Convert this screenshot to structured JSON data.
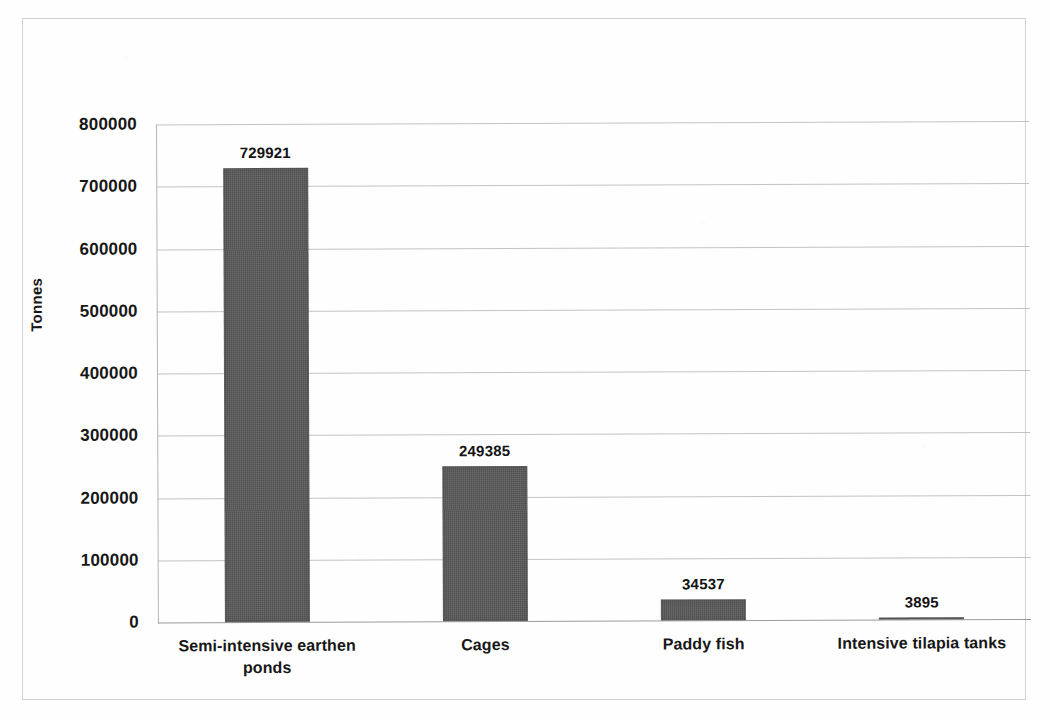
{
  "figure": {
    "background_color": "#ffffff",
    "border_color": "#d2d2d2",
    "bar_color": "#595959",
    "gridline_color": "#b9b9b9",
    "text_color": "#171717"
  },
  "axis": {
    "y_title": "Tonnes",
    "y_ticks": [
      "800000",
      "700000",
      "600000",
      "500000",
      "400000",
      "300000",
      "200000",
      "100000",
      "0"
    ]
  },
  "chart_data": {
    "type": "bar",
    "title": "",
    "xlabel": "",
    "ylabel": "Tonnes",
    "categories": [
      "Semi-intensive earthen ponds",
      "Cages",
      "Paddy fish",
      "Intensive tilapia tanks"
    ],
    "category_lines": [
      [
        "Semi-intensive earthen",
        "ponds"
      ],
      [
        "Cages"
      ],
      [
        "Paddy fish"
      ],
      [
        "Intensive tilapia tanks"
      ]
    ],
    "values": [
      729921,
      249385,
      34537,
      3895
    ],
    "value_labels": [
      "729921",
      "249385",
      "34537",
      "3895"
    ],
    "ylim": [
      0,
      800000
    ],
    "ytick_step": 100000,
    "grid": true,
    "legend": false,
    "series": [
      {
        "name": "Production",
        "values": [
          729921,
          249385,
          34537,
          3895
        ]
      }
    ]
  }
}
